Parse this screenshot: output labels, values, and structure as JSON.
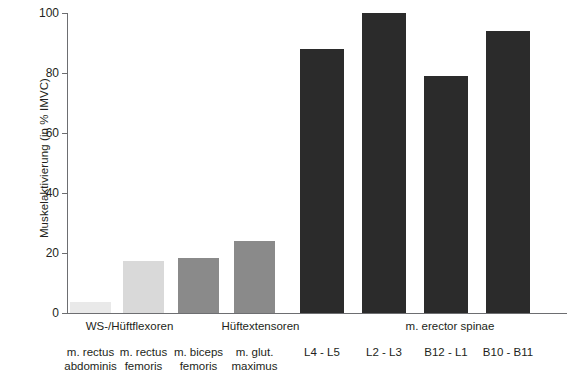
{
  "chart_data": {
    "type": "bar",
    "title": "",
    "xlabel": "",
    "ylabel": "Muskelaktivierung (in % IMVC)",
    "ylim": [
      0,
      100
    ],
    "yticks": [
      0,
      20,
      40,
      60,
      80,
      100
    ],
    "grid": false,
    "legend": "none",
    "categories": [
      "m. rectus abdominis",
      "m. rectus femoris",
      "m. biceps femoris",
      "m. glut. maximus",
      "L4 - L5",
      "L2 - L3",
      "B12 - L1",
      "B10 - B11"
    ],
    "values": [
      3.7,
      17.5,
      18.5,
      24,
      88,
      100,
      79,
      94
    ],
    "bar_colors": [
      "#e9e9e9",
      "#d9d9d9",
      "#8a8a8a",
      "#8a8a8a",
      "#2b2b2b",
      "#2b2b2b",
      "#2b2b2b",
      "#2b2b2b"
    ],
    "groups": [
      {
        "label": "WS-/Hüftflexoren",
        "members": [
          0,
          1
        ]
      },
      {
        "label": "Hüftextensoren",
        "members": [
          2,
          3
        ]
      },
      {
        "label": "m. erector spinae",
        "members": [
          4,
          5,
          6,
          7
        ]
      }
    ]
  },
  "axis": {
    "y_title": "Muskelaktivierung (in % IMVC)",
    "tick_labels": [
      "0",
      "20",
      "40",
      "60",
      "80",
      "100"
    ]
  },
  "bars": [
    {
      "name": "bar-m-rectus-abdominis",
      "value": 3.7,
      "color": "#e9e9e9",
      "label_line1": "m. rectus",
      "label_line2": "abdominis"
    },
    {
      "name": "bar-m-rectus-femoris",
      "value": 17.5,
      "color": "#d9d9d9",
      "label_line1": "m. rectus",
      "label_line2": "femoris"
    },
    {
      "name": "bar-m-biceps-femoris",
      "value": 18.5,
      "color": "#8a8a8a",
      "label_line1": "m. biceps",
      "label_line2": "femoris"
    },
    {
      "name": "bar-m-glut-maximus",
      "value": 24,
      "color": "#8a8a8a",
      "label_line1": "m. glut.",
      "label_line2": "maximus"
    },
    {
      "name": "bar-l4-l5",
      "value": 88,
      "color": "#2b2b2b",
      "label_line1": "L4 - L5",
      "label_line2": ""
    },
    {
      "name": "bar-l2-l3",
      "value": 100,
      "color": "#2b2b2b",
      "label_line1": "L2 - L3",
      "label_line2": ""
    },
    {
      "name": "bar-b12-l1",
      "value": 79,
      "color": "#2b2b2b",
      "label_line1": "B12 - L1",
      "label_line2": ""
    },
    {
      "name": "bar-b10-b11",
      "value": 94,
      "color": "#2b2b2b",
      "label_line1": "B10 - B11",
      "label_line2": ""
    }
  ],
  "groups": [
    {
      "name": "group-label-ws-hueftflexoren",
      "label": "WS-/Hüftflexoren"
    },
    {
      "name": "group-label-hueftextensoren",
      "label": "Hüftextensoren"
    },
    {
      "name": "group-label-m-erector-spinae",
      "label": "m. erector spinae"
    }
  ]
}
